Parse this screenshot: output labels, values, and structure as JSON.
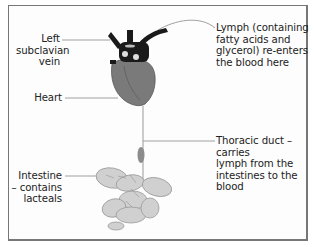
{
  "figure": {
    "labels": {
      "left_subclavian_vein": [
        "Left",
        "subclavian",
        "vein"
      ],
      "heart": [
        "Heart"
      ],
      "intestine": [
        "Intestine",
        "– contains",
        "lacteals"
      ],
      "lymph_reenters": [
        "Lymph (containing",
        "fatty acids and",
        "glycerol) re-enters",
        "the blood here"
      ],
      "thoracic_duct": [
        "Thoracic duct – carries",
        "lymph from the",
        "intestines to the blood"
      ]
    },
    "structures": [
      {
        "name": "heart",
        "color": "#7a7a7a"
      },
      {
        "name": "great-vessels",
        "color": "#1a1a1a"
      },
      {
        "name": "thoracic-duct",
        "color": "#9a9a9a"
      },
      {
        "name": "lymph-node",
        "color": "#8c8c8c"
      },
      {
        "name": "intestine",
        "color": "#d0d0d0"
      }
    ],
    "colors": {
      "frame_border": "#777777",
      "leader_line": "#888888",
      "text": "#222222"
    }
  }
}
